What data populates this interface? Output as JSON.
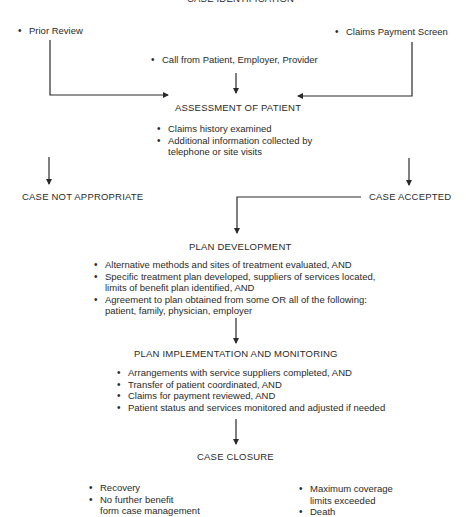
{
  "title": "CASE IDENTIFICATION",
  "sources": {
    "left": "Prior Review",
    "center": "Call from Patient, Employer, Provider",
    "right": "Claims Payment Screen"
  },
  "assessment": {
    "heading": "ASSESSMENT OF PATIENT",
    "items": [
      "Claims history examined",
      "Additional information collected by",
      "telephone or site visits"
    ]
  },
  "outcomes": {
    "rejected": "CASE NOT APPROPRIATE",
    "accepted": "CASE ACCEPTED"
  },
  "plan_development": {
    "heading": "PLAN DEVELOPMENT",
    "items": [
      {
        "line1": "Alternative methods and sites of treatment evaluated, AND"
      },
      {
        "line1": "Specific treatment plan developed, suppliers of services located,",
        "line2": "limits of benefit plan identified, AND"
      },
      {
        "line1": "Agreement to plan obtained from some OR all of the following:",
        "line2": "patient, family, physician, employer"
      }
    ]
  },
  "plan_implementation": {
    "heading": "PLAN IMPLEMENTATION AND MONITORING",
    "items": [
      "Arrangements with service suppliers completed, AND",
      "Transfer of patient coordinated, AND",
      "Claims for payment reviewed, AND",
      "Patient status and services monitored and adjusted if needed"
    ]
  },
  "case_closure": {
    "heading": "CASE CLOSURE",
    "left_items": [
      {
        "line1": "Recovery"
      },
      {
        "line1": "No further benefit",
        "line2": "form case management"
      }
    ],
    "right_items": [
      {
        "line1": "Maximum coverage",
        "line2": "limits exceeded"
      },
      {
        "line1": "Death"
      }
    ]
  },
  "colors": {
    "line": "#2a2a2a",
    "text": "#2a2a2a",
    "background": "#ffffff"
  }
}
